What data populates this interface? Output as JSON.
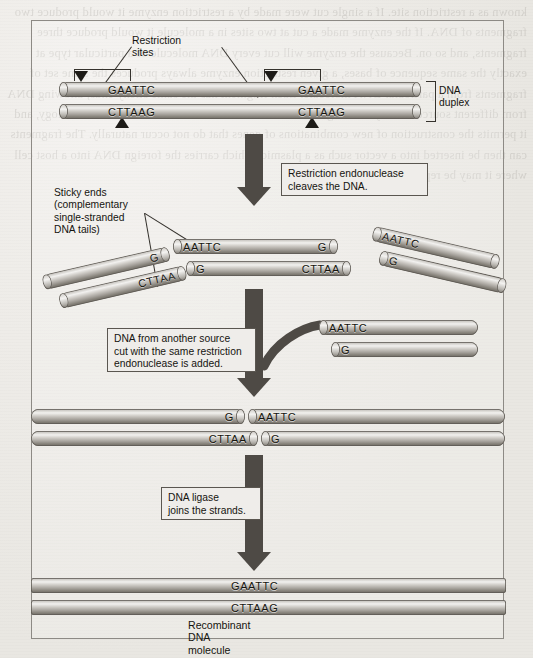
{
  "figure": {
    "title_label": "Recombinant DNA molecule",
    "background_page_text": "known as a restriction site. If a single cut were made by a restriction enzyme it would produce two fragments of DNA. If the enzyme made a cut at two sites in a molecule it would produce three fragments, and so on. Because the enzyme will cut every DNA molecule of a particular type at exactly the same sequence of bases, a given restriction enzyme always produces the same set of fragments from a particular DNA molecule. Each fragment has the same sticky ends, allowing DNA from different sources to be joined together. This is the basis of recombinant DNA technology, and it permits the construction of new combinations of genes that do not occur naturally. The fragments can then be inserted into a vector such as a plasmid, which carries the foreign DNA into a host cell where it may be replicated many times over."
  },
  "labels": {
    "restriction_sites": "Restriction sites",
    "dna_duplex": "DNA\nduplex",
    "sticky_ends": "Sticky ends (complementary\nsingle-stranded DNA tails)",
    "recombinant": "Recombinant DNA molecule"
  },
  "steps": [
    {
      "id": "step-cleave",
      "text": "Restriction endonuclease\ncleaves the DNA."
    },
    {
      "id": "step-add-source",
      "text": "DNA from another source\ncut with the same restriction\nendonuclease is added."
    },
    {
      "id": "step-ligase",
      "text": "DNA ligase\njoins the strands."
    }
  ],
  "sequences": {
    "top_strand_site": "GAATTC",
    "bottom_strand_site": "CTTAAG",
    "sticky_aattc": "AATTC",
    "sticky_g": "G",
    "sticky_cttaa": "CTTAA",
    "recombinant_top": "GAATTC",
    "recombinant_bottom": "CTTAAG"
  },
  "stage1": {
    "name": "intact-dna-duplex",
    "top_sites": [
      "GAATTC",
      "GAATTC"
    ],
    "bottom_sites": [
      "CTTAAG",
      "CTTAAG"
    ]
  },
  "stage2": {
    "name": "cleaved-fragments",
    "center_top_left": "AATTC",
    "center_top_right": "G",
    "center_bottom_left": "G",
    "center_bottom_right": "CTTAA",
    "left_fragment_top": "G",
    "left_fragment_bottom": "CTTAA",
    "right_fragment_top": "AATTC",
    "right_fragment_bottom": "G"
  },
  "stage3": {
    "name": "foreign-dna-added",
    "incoming_top": "AATTC",
    "incoming_bottom": "G",
    "annealed_left_top": "G",
    "annealed_right_top": "AATTC",
    "annealed_left_bottom": "CTTAA",
    "annealed_right_bottom": "G"
  },
  "stage4": {
    "name": "ligated-recombinant",
    "top": "GAATTC",
    "bottom": "CTTAAG"
  },
  "colors": {
    "paper": "#eceae6",
    "frame_border": "#8d8a85",
    "arrow": "#4e4a45",
    "ink": "#15140f",
    "dna_highlight": "#f2f1ef",
    "dna_shadow": "#6e6a63"
  }
}
